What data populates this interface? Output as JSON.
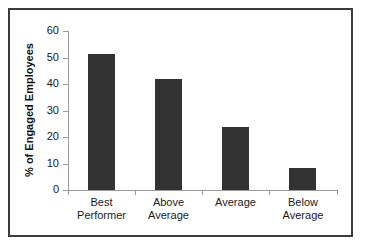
{
  "chart_data": {
    "type": "bar",
    "title": "",
    "xlabel": "",
    "ylabel": "% of Engaged Employees",
    "categories": [
      "Best Performer",
      "Above Average",
      "Average",
      "Below Average"
    ],
    "category_lines": [
      [
        "Best",
        "Performer"
      ],
      [
        "Above",
        "Average"
      ],
      [
        "Average",
        ""
      ],
      [
        "Below",
        "Average"
      ]
    ],
    "values": [
      51.3,
      42.0,
      23.8,
      8.3
    ],
    "ylim": [
      0,
      60
    ],
    "ytick_values": [
      60,
      50,
      40,
      30,
      20,
      10,
      0
    ],
    "ytick_labels": [
      "60",
      "50",
      "40",
      "30",
      "20",
      "10",
      "0"
    ],
    "grid": false,
    "legend": false,
    "legend_position": "none",
    "bar_color": "#333333",
    "axis_color": "#9a9a9a",
    "frame_color": "#3b3b3b",
    "background_color": "#ffffff"
  }
}
